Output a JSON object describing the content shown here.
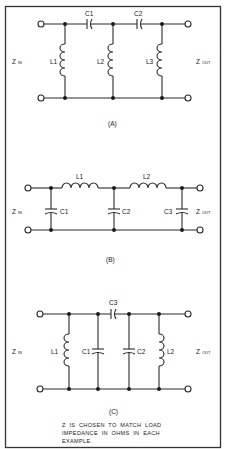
{
  "figure": {
    "circuits": [
      {
        "id": "A",
        "caption": "(A)",
        "z_in": {
          "main": "Z",
          "sub": "IN"
        },
        "z_out": {
          "main": "Z",
          "sub": "OUT"
        },
        "components": {
          "series": [
            {
              "label": "C1",
              "type": "capacitor"
            },
            {
              "label": "C2",
              "type": "capacitor"
            }
          ],
          "shunt": [
            {
              "label": "L1",
              "type": "inductor"
            },
            {
              "label": "L2",
              "type": "inductor"
            },
            {
              "label": "L3",
              "type": "inductor"
            }
          ]
        }
      },
      {
        "id": "B",
        "caption": "(B)",
        "z_in": {
          "main": "Z",
          "sub": "IN"
        },
        "z_out": {
          "main": "Z",
          "sub": "OUT"
        },
        "components": {
          "series": [
            {
              "label": "L1",
              "type": "inductor"
            },
            {
              "label": "L2",
              "type": "inductor"
            }
          ],
          "shunt": [
            {
              "label": "C1",
              "type": "capacitor"
            },
            {
              "label": "C2",
              "type": "capacitor"
            },
            {
              "label": "C3",
              "type": "capacitor"
            }
          ]
        }
      },
      {
        "id": "C",
        "caption": "(C)",
        "z_in": {
          "main": "Z",
          "sub": "IN"
        },
        "z_out": {
          "main": "Z",
          "sub": "OUT"
        },
        "components": {
          "series": [
            {
              "label": "C3",
              "type": "capacitor"
            }
          ],
          "shunt": [
            {
              "label": "L1",
              "type": "inductor"
            },
            {
              "label": "C1",
              "type": "capacitor"
            },
            {
              "label": "C2",
              "type": "capacitor"
            },
            {
              "label": "L2",
              "type": "inductor"
            }
          ]
        }
      }
    ],
    "note_lines": [
      "Z  IS  CHOSEN  TO  MATCH  LOAD",
      "IMPEDANCE  IN  OHMS  IN  EACH",
      "EXAMPLE."
    ]
  }
}
